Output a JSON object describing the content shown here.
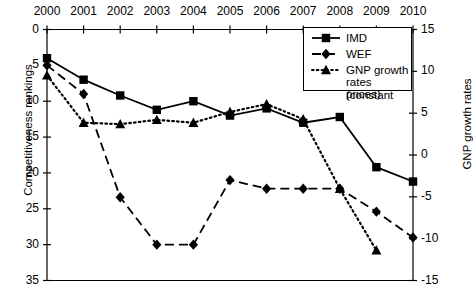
{
  "chart_data": {
    "type": "line",
    "title": "",
    "xlabel": "",
    "ylabel": "Competitiveness rankings",
    "ylabel_right": "GNP growth rates",
    "categories": [
      "2000",
      "2001",
      "2002",
      "2003",
      "2004",
      "2005",
      "2006",
      "2007",
      "2008",
      "2009",
      "2010"
    ],
    "x": [
      2000,
      2001,
      2002,
      2003,
      2004,
      2005,
      2006,
      2007,
      2008,
      2009,
      2010
    ],
    "ylim": [
      35,
      0
    ],
    "yticks": [
      0,
      5,
      10,
      15,
      20,
      25,
      30,
      35
    ],
    "ylim_right": [
      -15,
      15
    ],
    "yticks_right": [
      15,
      10,
      5,
      0,
      -5,
      -10,
      -15
    ],
    "grid": false,
    "legend_position": "top-right",
    "series": [
      {
        "name": "IMD",
        "axis": "left",
        "line_style": "solid",
        "marker": "square",
        "color": "#000000",
        "values": [
          4,
          7,
          9.2,
          11.2,
          10,
          12,
          11,
          13,
          12.2,
          19.2,
          21.2
        ]
      },
      {
        "name": "WEF",
        "axis": "left",
        "line_style": "dashed",
        "marker": "diamond",
        "color": "#000000",
        "values": [
          5,
          9,
          23.4,
          30,
          30,
          21,
          22.2,
          22.2,
          22.2,
          25.4,
          29
        ]
      },
      {
        "name": "GNP growth rates (constant prices)",
        "axis": "right",
        "line_style": "dotted",
        "marker": "triangle",
        "color": "#000000",
        "values_left_scale": [
          6.4,
          13,
          13.2,
          12.6,
          13,
          11.5,
          10.4,
          12.5,
          22.2,
          30.8
        ],
        "values": [
          9.5,
          4.4,
          4.2,
          4.6,
          4.4,
          5.5,
          6.2,
          4.6,
          -1.2,
          -10.2
        ],
        "x": [
          2000,
          2001,
          2002,
          2003,
          2004,
          2005,
          2006,
          2007,
          2008,
          2009
        ]
      }
    ]
  },
  "legend": {
    "items": [
      {
        "label": "IMD",
        "marker": "square",
        "style": "solid"
      },
      {
        "label": "WEF",
        "marker": "diamond",
        "style": "dashed"
      },
      {
        "label": "GNP growth rates (constant prices)",
        "marker": "triangle",
        "style": "dotted",
        "line1": "GNP growth",
        "line2": "rates (constant",
        "line3": "prices)"
      }
    ]
  },
  "axes": {
    "left_title": "Competitiveness rankings",
    "right_title": "GNP growth rates",
    "x_labels": [
      "2000",
      "2001",
      "2002",
      "2003",
      "2004",
      "2005",
      "2006",
      "2007",
      "2008",
      "2009",
      "2010"
    ],
    "y_left_labels": [
      "0",
      "5",
      "10",
      "15",
      "20",
      "25",
      "30",
      "35"
    ],
    "y_right_labels": [
      "15",
      "10",
      "5",
      "0",
      "-5",
      "-10",
      "-15"
    ]
  }
}
